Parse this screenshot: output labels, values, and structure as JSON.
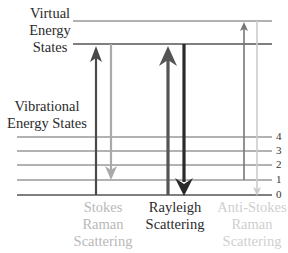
{
  "labels": {
    "virtual": [
      "Virtual",
      "Energy",
      "States"
    ],
    "vibrational": [
      "Vibrational",
      "Energy States"
    ],
    "stokes": [
      "Stokes",
      "Raman",
      "Scattering"
    ],
    "rayleigh": [
      "Rayleigh",
      "Scattering"
    ],
    "anti_stokes": [
      "Anti-Stokes",
      "Raman",
      "Scattering"
    ]
  },
  "levels": [
    "4",
    "3",
    "2",
    "1",
    "0"
  ],
  "colors": {
    "line": "#555555",
    "dark_arrow": "#444444",
    "darker_arrow": "#2a2a2a",
    "light_arrow": "#aaaaaa",
    "lighter_arrow": "#cccccc",
    "light_text": "#b8b8b8",
    "dark_text": "#2b2b2b"
  }
}
